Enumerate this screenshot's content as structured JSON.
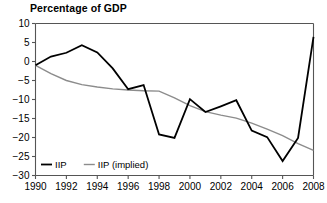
{
  "chart_data": {
    "type": "line",
    "title": "Percentage of GDP",
    "xlabel": "",
    "ylabel": "",
    "xlim": [
      1990,
      2008
    ],
    "ylim": [
      -30,
      10
    ],
    "ytick_labels": [
      "10",
      "5",
      "0",
      "−5",
      "−10",
      "−15",
      "−20",
      "−25",
      "−30"
    ],
    "ytick_values": [
      10,
      5,
      0,
      -5,
      -10,
      -15,
      -20,
      -25,
      -30
    ],
    "xtick_labels": [
      "1990",
      "1992",
      "1994",
      "1996",
      "1998",
      "2000",
      "2002",
      "2004",
      "2006",
      "2008"
    ],
    "xtick_values": [
      1990,
      1992,
      1994,
      1996,
      1998,
      2000,
      2002,
      2004,
      2006,
      2008
    ],
    "grid": false,
    "legend_position": "bottom-left",
    "x": [
      1990,
      1991,
      1992,
      1993,
      1994,
      1995,
      1996,
      1997,
      1998,
      1999,
      2000,
      2001,
      2002,
      2003,
      2004,
      2005,
      2006,
      2007,
      2008
    ],
    "series": [
      {
        "name": "IIP",
        "color": "#000000",
        "width": 1.8,
        "values": [
          -1.0,
          1.3,
          2.3,
          4.3,
          2.4,
          -1.8,
          -7.3,
          -6.2,
          -19.2,
          -20.1,
          -9.9,
          -13.3,
          -11.8,
          -10.2,
          -18.2,
          -19.9,
          -26.2,
          -20.1,
          6.5
        ]
      },
      {
        "name": "IIP (implied)",
        "color": "#8c8c8c",
        "width": 1.4,
        "values": [
          -1.0,
          -3.2,
          -5.0,
          -6.1,
          -6.7,
          -7.2,
          -7.5,
          -7.7,
          -7.8,
          -9.6,
          -11.6,
          -13.2,
          -14.1,
          -14.9,
          -16.2,
          -17.8,
          -19.5,
          -21.6,
          -23.4
        ]
      }
    ]
  },
  "legend": {
    "items": [
      {
        "label": "IIP",
        "color": "#000000"
      },
      {
        "label": "IIP (implied)",
        "color": "#8c8c8c"
      }
    ]
  },
  "axes": {
    "axis_color": "#555555",
    "tick_color": "#555555"
  }
}
